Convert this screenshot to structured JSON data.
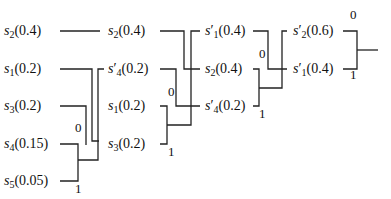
{
  "diagram": {
    "type": "huffman-coding-tree",
    "line_color": "#222222",
    "columns": [
      {
        "stage": 1,
        "nodes": [
          {
            "id": "s2",
            "sym": "s",
            "sub": "2",
            "prime": "",
            "prob": "(0.4)",
            "x": 4,
            "y": 25
          },
          {
            "id": "s1",
            "sym": "s",
            "sub": "1",
            "prime": "",
            "prob": "(0.2)",
            "x": 4,
            "y": 63
          },
          {
            "id": "s3",
            "sym": "s",
            "sub": "3",
            "prime": "",
            "prob": "(0.2)",
            "x": 4,
            "y": 100
          },
          {
            "id": "s4",
            "sym": "s",
            "sub": "4",
            "prime": "",
            "prob": "(0.15)",
            "x": 4,
            "y": 138
          },
          {
            "id": "s5",
            "sym": "s",
            "sub": "5",
            "prime": "",
            "prob": "(0.05)",
            "x": 4,
            "y": 175
          }
        ]
      },
      {
        "stage": 2,
        "nodes": [
          {
            "id": "s2b",
            "sym": "s",
            "sub": "2",
            "prime": "",
            "prob": "(0.4)",
            "x": 108,
            "y": 25
          },
          {
            "id": "s4p",
            "sym": "s",
            "sub": "4",
            "prime": "′",
            "prob": "(0.2)",
            "x": 108,
            "y": 63
          },
          {
            "id": "s1b",
            "sym": "s",
            "sub": "1",
            "prime": "",
            "prob": "(0.2)",
            "x": 108,
            "y": 100
          },
          {
            "id": "s3b",
            "sym": "s",
            "sub": "3",
            "prime": "",
            "prob": "(0.2)",
            "x": 108,
            "y": 138
          }
        ]
      },
      {
        "stage": 3,
        "nodes": [
          {
            "id": "s1p",
            "sym": "s",
            "sub": "1",
            "prime": "′",
            "prob": "(0.4)",
            "x": 205,
            "y": 25
          },
          {
            "id": "s2c",
            "sym": "s",
            "sub": "2",
            "prime": "",
            "prob": "(0.4)",
            "x": 205,
            "y": 63
          },
          {
            "id": "s4pb",
            "sym": "s",
            "sub": "4",
            "prime": "′",
            "prob": "(0.2)",
            "x": 205,
            "y": 100
          }
        ]
      },
      {
        "stage": 4,
        "nodes": [
          {
            "id": "s2p",
            "sym": "s",
            "sub": "2",
            "prime": "′",
            "prob": "(0.6)",
            "x": 293,
            "y": 25
          },
          {
            "id": "s1pb",
            "sym": "s",
            "sub": "1",
            "prime": "′",
            "prob": "(0.4)",
            "x": 293,
            "y": 63
          }
        ]
      }
    ],
    "bits": [
      {
        "text": "0",
        "x": 75,
        "y": 121
      },
      {
        "text": "1",
        "x": 75,
        "y": 182
      },
      {
        "text": "0",
        "x": 168,
        "y": 85
      },
      {
        "text": "1",
        "x": 168,
        "y": 145
      },
      {
        "text": "0",
        "x": 259,
        "y": 47
      },
      {
        "text": "1",
        "x": 259,
        "y": 107
      },
      {
        "text": "0",
        "x": 350,
        "y": 8
      },
      {
        "text": "1",
        "x": 350,
        "y": 68
      }
    ],
    "edges": [
      "M58,31 H99",
      "M58,69 H90 V139 H99",
      "M58,106 H84 V145",
      "M64,144 H78 V181 H64",
      "M78,162 H96 V69 H104",
      "M96,69 V69",
      "M64,144 H64",
      "M158,31 H185 V69 H200",
      "M158,69 H176 V106 H200",
      "M158,106 H166 V144",
      "M158,144 H166 V144",
      "M166,126 H192 V31 H200",
      "M250,31 H268 V69 H287",
      "M250,69 H260 V106 H250",
      "M260,88 H276 V31 H287",
      "M342,31 H358 V69 H342",
      "M358,50 H378"
    ]
  }
}
